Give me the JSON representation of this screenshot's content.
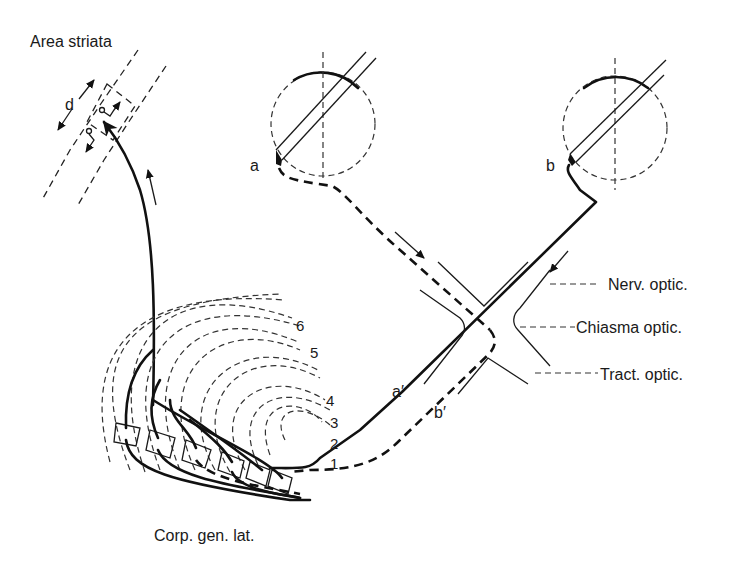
{
  "labels": {
    "area_striata": "Area striata",
    "d": "d",
    "eye_a": "a",
    "eye_b": "b",
    "a_prime": "a′",
    "b_prime": "b′",
    "nerv_optic": "Nerv. optic.",
    "chiasma_optic": "Chiasma optic.",
    "tract_optic": "Tract. optic.",
    "corp_gen_lat": "Corp. gen. lat."
  },
  "layers": [
    "1",
    "2",
    "3",
    "4",
    "5",
    "6"
  ],
  "colors": {
    "ink": "#111111",
    "background": "#ffffff"
  }
}
